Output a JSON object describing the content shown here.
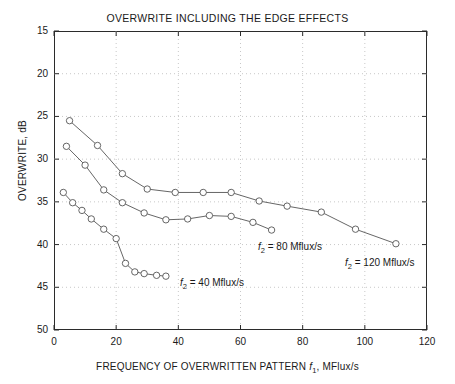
{
  "chart_data": {
    "type": "line",
    "title": "OVERWRITE INCLUDING THE EDGE EFFECTS",
    "xlabel": "FREQUENCY OF OVERWRITTEN PATTERN f₁, MFlux/s",
    "ylabel": "OVERWRITE, dB",
    "xlim": [
      0,
      120
    ],
    "ylim": [
      15,
      50
    ],
    "y_inverted": true,
    "grid": true,
    "legend_position": "inline-annotations",
    "xticks": [
      0,
      20,
      40,
      60,
      80,
      100,
      120
    ],
    "yticks": [
      15,
      20,
      25,
      30,
      35,
      40,
      45,
      50
    ],
    "marker": "open-circle",
    "series": [
      {
        "name": "f2 = 120 Mflux/s",
        "label_html": "<i>f</i><sub>2</sub> = 120 Mflux/s",
        "points": [
          [
            5,
            25.5
          ],
          [
            14,
            28.4
          ],
          [
            22,
            31.7
          ],
          [
            30,
            33.5
          ],
          [
            39,
            33.9
          ],
          [
            48,
            33.9
          ],
          [
            57,
            33.9
          ],
          [
            66,
            34.9
          ],
          [
            75,
            35.5
          ],
          [
            86,
            36.2
          ],
          [
            97,
            38.2
          ],
          [
            110,
            39.9
          ]
        ]
      },
      {
        "name": "f2 = 80 Mflux/s",
        "label_html": "<i>f</i><sub>2</sub> = 80 Mflux/s",
        "points": [
          [
            4,
            28.5
          ],
          [
            10,
            30.7
          ],
          [
            16,
            33.6
          ],
          [
            22,
            35.1
          ],
          [
            29,
            36.3
          ],
          [
            36,
            37.1
          ],
          [
            43,
            37.0
          ],
          [
            50,
            36.6
          ],
          [
            57,
            36.7
          ],
          [
            64,
            37.4
          ],
          [
            70,
            38.3
          ]
        ]
      },
      {
        "name": "f2 = 40 Mflux/s",
        "label_html": "<i>f</i><sub>2</sub> = 40 Mflux/s",
        "points": [
          [
            3,
            33.9
          ],
          [
            6,
            35.1
          ],
          [
            9,
            36.0
          ],
          [
            12,
            37.0
          ],
          [
            16,
            38.2
          ],
          [
            20,
            39.3
          ],
          [
            23,
            42.2
          ],
          [
            26,
            43.2
          ],
          [
            29,
            43.4
          ],
          [
            33,
            43.6
          ],
          [
            36,
            43.7
          ]
        ]
      }
    ],
    "annotations": [
      {
        "id": "ann-f2-40",
        "text": "f2 = 40 Mflux/s",
        "html": "<i>f</i><sub>2</sub> = 40 Mflux/s",
        "x_px": 180,
        "y_px": 277
      },
      {
        "id": "ann-f2-80",
        "text": "f2 = 80 Mflux/s",
        "html": "<i>f</i><sub>2</sub> = 80 Mflux/s",
        "x_px": 258,
        "y_px": 241
      },
      {
        "id": "ann-f2-120",
        "text": "f2 = 120 Mflux/s",
        "html": "<i>f</i><sub>2</sub> = 120 Mflux/s",
        "x_px": 345,
        "y_px": 257
      }
    ],
    "colors": {
      "line": "#555555",
      "marker_stroke": "#555555",
      "marker_fill": "#ffffff",
      "axis": "#2b2b2b",
      "grid": "#c8c8c8",
      "text": "#1a1a1a"
    }
  }
}
